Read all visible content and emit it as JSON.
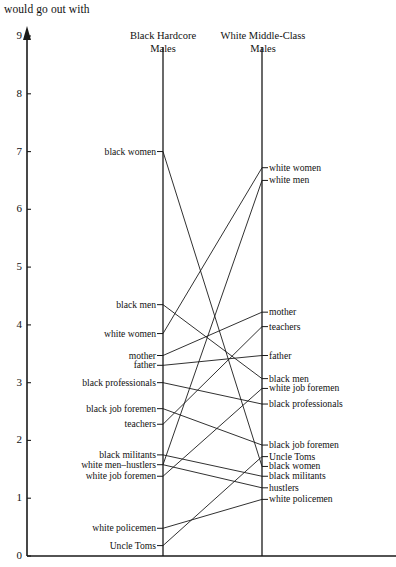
{
  "axis": {
    "title": "would go out with",
    "ticks": [
      {
        "value": "9",
        "y": 36
      },
      {
        "value": "8",
        "y": 93.8
      },
      {
        "value": "7",
        "y": 151.6
      },
      {
        "value": "6",
        "y": 209.3
      },
      {
        "value": "5",
        "y": 267.1
      },
      {
        "value": "4",
        "y": 324.9
      },
      {
        "value": "3",
        "y": 382.7
      },
      {
        "value": "2",
        "y": 440.4
      },
      {
        "value": "1",
        "y": 498.2
      },
      {
        "value": "0",
        "y": 556
      }
    ]
  },
  "columns": {
    "left": {
      "title_line1": "Black Hardcore",
      "title_line2": "Males"
    },
    "right": {
      "title_line1": "White Middle-Class",
      "title_line2": "Males"
    }
  },
  "chart_data": {
    "type": "line",
    "title": "would go out with",
    "ylabel": "would go out with",
    "xlabel": "",
    "ylim": [
      0,
      9
    ],
    "grid": false,
    "legend": "none",
    "categories": [
      "Black Hardcore Males",
      "White Middle-Class Males"
    ],
    "left_items": [
      {
        "label": "black women",
        "value": 7.0
      },
      {
        "label": "black men",
        "value": 4.35
      },
      {
        "label": "white women",
        "value": 3.85
      },
      {
        "label": "mother",
        "value": 3.47
      },
      {
        "label": "father",
        "value": 3.3
      },
      {
        "label": "black professionals",
        "value": 3.0
      },
      {
        "label": "black job foremen",
        "value": 2.55
      },
      {
        "label": "teachers",
        "value": 2.28
      },
      {
        "label": "black militants",
        "value": 1.75
      },
      {
        "label": "white men–hustlers",
        "value": 1.58
      },
      {
        "label": "white job foremen",
        "value": 1.38
      },
      {
        "label": "white policemen",
        "value": 0.48
      },
      {
        "label": "Uncle Toms",
        "value": 0.18
      }
    ],
    "right_items": [
      {
        "label": "white women",
        "value": 6.72
      },
      {
        "label": "white men",
        "value": 6.5
      },
      {
        "label": "mother",
        "value": 4.22
      },
      {
        "label": "teachers",
        "value": 3.97
      },
      {
        "label": "father",
        "value": 3.47
      },
      {
        "label": "black men",
        "value": 3.07
      },
      {
        "label": "white job foremen",
        "value": 2.9
      },
      {
        "label": "black professionals",
        "value": 2.63
      },
      {
        "label": "black job foremen",
        "value": 1.92
      },
      {
        "label": "Uncle Toms",
        "value": 1.72
      },
      {
        "label": "black women",
        "value": 1.55
      },
      {
        "label": "black militants",
        "value": 1.38
      },
      {
        "label": "hustlers",
        "value": 1.18
      },
      {
        "label": "white policemen",
        "value": 0.98
      }
    ],
    "connections": [
      {
        "from": "black women",
        "to": "black women"
      },
      {
        "from": "black men",
        "to": "black men"
      },
      {
        "from": "white women",
        "to": "white women"
      },
      {
        "from": "mother",
        "to": "mother"
      },
      {
        "from": "father",
        "to": "father"
      },
      {
        "from": "black professionals",
        "to": "black professionals"
      },
      {
        "from": "black job foremen",
        "to": "black job foremen"
      },
      {
        "from": "teachers",
        "to": "teachers"
      },
      {
        "from": "black militants",
        "to": "black militants"
      },
      {
        "from": "white men–hustlers",
        "to": "white men"
      },
      {
        "from": "white men–hustlers",
        "to": "hustlers"
      },
      {
        "from": "white job foremen",
        "to": "white job foremen"
      },
      {
        "from": "white policemen",
        "to": "white policemen"
      },
      {
        "from": "Uncle Toms",
        "to": "Uncle Toms"
      }
    ]
  },
  "geometry": {
    "axis_x": 27,
    "axis_top": 31,
    "baseline_y": 556,
    "baseline_right": 396,
    "left_col_x": 163,
    "right_col_x": 262,
    "col_top": 47,
    "y0": 556,
    "unit": 57.78,
    "tick_len": 6
  }
}
